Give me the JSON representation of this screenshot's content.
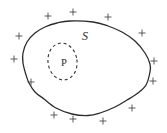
{
  "canvas": {
    "width": 167,
    "height": 133,
    "background": "#ffffff"
  },
  "diagram": {
    "stroke_color": "#2b2b2b",
    "plus_color": "#4a4a4a",
    "outline_points": [
      [
        70,
        21
      ],
      [
        93,
        22
      ],
      [
        108,
        26
      ],
      [
        122,
        32
      ],
      [
        135,
        41
      ],
      [
        145,
        53
      ],
      [
        150,
        64
      ],
      [
        150,
        72
      ],
      [
        146,
        85
      ],
      [
        138,
        93
      ],
      [
        127,
        100
      ],
      [
        115,
        107
      ],
      [
        100,
        113
      ],
      [
        88,
        115.5
      ],
      [
        72,
        114
      ],
      [
        56,
        108
      ],
      [
        44,
        99
      ],
      [
        35,
        92
      ],
      [
        29,
        83
      ],
      [
        26,
        75
      ],
      [
        23,
        63
      ],
      [
        23,
        53
      ],
      [
        27,
        42
      ],
      [
        35,
        33
      ],
      [
        45,
        27
      ],
      [
        57,
        23
      ]
    ],
    "dashed_ellipse": {
      "cx": 62.5,
      "cy": 61.5,
      "rx": 14.5,
      "ry": 18.5,
      "rotation": -8,
      "dash": "3 2.8",
      "color": "#333333"
    },
    "s_label": {
      "text": "S",
      "x": 82,
      "y": 40
    },
    "p_label": {
      "text": "P",
      "x": 64,
      "y": 66
    },
    "plus_markers": [
      [
        48,
        16
      ],
      [
        73,
        12
      ],
      [
        108,
        17
      ],
      [
        19,
        36
      ],
      [
        14,
        59
      ],
      [
        31,
        82
      ],
      [
        142,
        33
      ],
      [
        154,
        61
      ],
      [
        153,
        81
      ],
      [
        132,
        108
      ],
      [
        103,
        121
      ],
      [
        73,
        119
      ],
      [
        54,
        115
      ]
    ],
    "plus_arm": 3.1
  }
}
